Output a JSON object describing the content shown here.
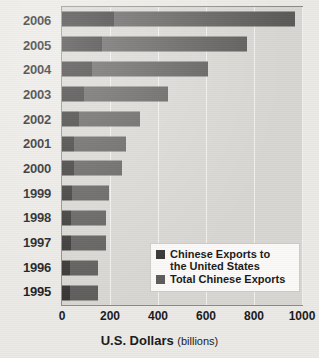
{
  "chart_data": {
    "type": "bar",
    "orientation": "horizontal",
    "stacked": false,
    "title": "",
    "xlabel": "U.S. Dollars",
    "xlabel_suffix": "(billions)",
    "ylabel": "",
    "xlim": [
      0,
      1000
    ],
    "xticks": [
      0,
      200,
      400,
      600,
      800,
      1000
    ],
    "xticklabels": [
      "0",
      "200",
      "400",
      "600",
      "800",
      "1000"
    ],
    "grid": true,
    "grid_axis": "x",
    "legend_position": "lower right (inside plot)",
    "categories": [
      "2006",
      "2005",
      "2004",
      "2003",
      "2002",
      "2001",
      "2000",
      "1999",
      "1998",
      "1997",
      "1996",
      "1995"
    ],
    "series": [
      {
        "name": "Chinese Exports to the United States",
        "color": "#333231",
        "values": [
          215,
          165,
          125,
          92,
          70,
          52,
          52,
          42,
          38,
          38,
          34,
          32
        ]
      },
      {
        "name": "Total Chinese Exports",
        "color": "#5c5b59",
        "values": [
          970,
          770,
          610,
          440,
          325,
          265,
          250,
          195,
          184,
          183,
          152,
          148
        ]
      }
    ]
  },
  "legend": {
    "items": [
      {
        "label_line1": "Chinese Exports to",
        "label_line2": "the United States",
        "swatch": "dark"
      },
      {
        "label_line1": "Total Chinese Exports",
        "label_line2": "",
        "swatch": "light"
      }
    ]
  },
  "axis": {
    "title_bold": "U.S. Dollars",
    "title_light": "(billions)"
  }
}
